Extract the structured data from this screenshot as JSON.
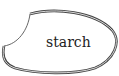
{
  "diagram": {
    "shape": "starch-granule-blob",
    "label": "starch",
    "outline_color": "#444444"
  }
}
